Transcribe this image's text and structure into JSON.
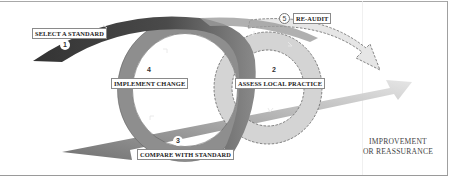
{
  "diagram": {
    "type": "audit-cycle",
    "steps": [
      {
        "number": "1",
        "label": "SELECT A STANDARD"
      },
      {
        "number": "2",
        "label": "ASSESS LOCAL PRACTICE"
      },
      {
        "number": "3",
        "label": "COMPARE WITH STANDARD"
      },
      {
        "number": "4",
        "label": "IMPLEMENT CHANGE"
      },
      {
        "number": "5",
        "label": "RE-AUDIT"
      }
    ],
    "outcome": {
      "line1": "IMPROVEMENT",
      "line2": "OR REASSURANCE"
    },
    "colors": {
      "dark_arc": "#3c3c3c",
      "mid_loop": "#8e8e8e",
      "light_loop": "#d6d6d6",
      "arrow_gradient_start": "#6e6e6e",
      "arrow_gradient_end": "#e2e2e2",
      "frame": "#9a9a9a"
    }
  }
}
